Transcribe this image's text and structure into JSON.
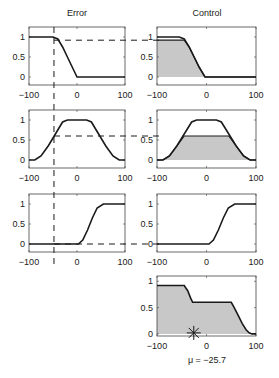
{
  "chart_data": [
    {
      "type": "line",
      "title": "Error",
      "panel": "error-row1",
      "xlim": [
        -100,
        100
      ],
      "ylim": [
        -0.2,
        1.25
      ],
      "xticks": [
        -100,
        0,
        100
      ],
      "yticks": [
        0,
        0.5,
        1
      ],
      "series": [
        {
          "name": "Z-shaped",
          "x": [
            -100,
            -50,
            -40,
            -30,
            -20,
            -10,
            0,
            100
          ],
          "y": [
            1,
            1,
            0.95,
            0.75,
            0.5,
            0.25,
            0,
            0
          ]
        }
      ],
      "input_line_x": -48,
      "membership_at_input": 0.92
    },
    {
      "type": "line",
      "panel": "error-row2",
      "xlim": [
        -100,
        100
      ],
      "ylim": [
        -0.2,
        1.25
      ],
      "xticks": [
        -100,
        0,
        100
      ],
      "yticks": [
        0,
        0.5,
        1
      ],
      "series": [
        {
          "name": "trapezoid",
          "x": [
            -100,
            -88,
            -75,
            -60,
            -45,
            -30,
            -20,
            20,
            30,
            45,
            60,
            75,
            88,
            100
          ],
          "y": [
            0,
            0,
            0.1,
            0.35,
            0.65,
            0.95,
            1,
            1,
            0.95,
            0.65,
            0.35,
            0.1,
            0,
            0
          ]
        }
      ],
      "membership_at_input": 0.6
    },
    {
      "type": "line",
      "panel": "error-row3",
      "xlim": [
        -100,
        100
      ],
      "ylim": [
        -0.2,
        1.25
      ],
      "xticks": [
        -100,
        0,
        100
      ],
      "yticks": [
        0,
        0.5,
        1
      ],
      "series": [
        {
          "name": "S-shaped",
          "x": [
            -100,
            3,
            12,
            22,
            32,
            42,
            55,
            100
          ],
          "y": [
            0,
            0,
            0.1,
            0.35,
            0.65,
            0.9,
            1,
            1
          ]
        }
      ],
      "membership_at_input": 0
    },
    {
      "type": "area",
      "title": "Control",
      "panel": "control-row1",
      "xlim": [
        -100,
        100
      ],
      "ylim": [
        -0.2,
        1.25
      ],
      "xticks": [
        -100,
        0,
        100
      ],
      "yticks": [
        0,
        0.5,
        1
      ],
      "series": [
        {
          "name": "Z-shaped",
          "x": [
            -100,
            -55,
            -45,
            -35,
            -25,
            -15,
            -3,
            100
          ],
          "y": [
            1,
            1,
            0.95,
            0.75,
            0.5,
            0.25,
            0,
            0
          ]
        }
      ],
      "clip_level": 0.92
    },
    {
      "type": "area",
      "panel": "control-row2",
      "xlim": [
        -100,
        100
      ],
      "ylim": [
        -0.2,
        1.25
      ],
      "xticks": [
        -100,
        0,
        100
      ],
      "yticks": [
        0,
        0.5,
        1
      ],
      "series": [
        {
          "name": "trapezoid",
          "x": [
            -100,
            -88,
            -75,
            -60,
            -45,
            -30,
            -20,
            20,
            30,
            45,
            60,
            75,
            88,
            100
          ],
          "y": [
            0,
            0,
            0.1,
            0.35,
            0.65,
            0.95,
            1,
            1,
            0.95,
            0.65,
            0.35,
            0.1,
            0,
            0
          ]
        }
      ],
      "clip_level": 0.6
    },
    {
      "type": "area",
      "panel": "control-row3",
      "xlim": [
        -100,
        100
      ],
      "ylim": [
        -0.2,
        1.25
      ],
      "xticks": [
        -100,
        0,
        100
      ],
      "yticks": [
        0,
        0.5,
        1
      ],
      "series": [
        {
          "name": "S-shaped",
          "x": [
            -100,
            5,
            14,
            24,
            34,
            44,
            57,
            100
          ],
          "y": [
            0,
            0,
            0.1,
            0.35,
            0.65,
            0.9,
            1,
            1
          ]
        }
      ],
      "clip_level": 0
    },
    {
      "type": "area",
      "panel": "aggregate",
      "xlim": [
        -100,
        100
      ],
      "ylim": [
        -0.04,
        1.1
      ],
      "xticks": [
        -100,
        0,
        100
      ],
      "yticks": [
        0,
        0.5,
        1
      ],
      "series": [
        {
          "name": "aggregated output",
          "x": [
            -100,
            -45,
            -38,
            -32,
            -28,
            50,
            56,
            64,
            72,
            80,
            86,
            92,
            100
          ],
          "y": [
            0.92,
            0.92,
            0.82,
            0.68,
            0.6,
            0.6,
            0.5,
            0.35,
            0.2,
            0.08,
            0.02,
            0,
            0
          ]
        }
      ],
      "centroid_x": -25.7,
      "xlabel": "μ = −25.7"
    }
  ],
  "labels": {
    "col_error": "Error",
    "col_control": "Control",
    "centroid": "μ = −25.7",
    "xtick_left": "−100",
    "xtick_mid": "0",
    "xtick_right": "100",
    "ytick_1": "1",
    "ytick_05": "0.5",
    "ytick_0": "0"
  },
  "colors": {
    "line": "#1a1a1a",
    "fill": "#c8c8c8",
    "axes": "#444444"
  }
}
